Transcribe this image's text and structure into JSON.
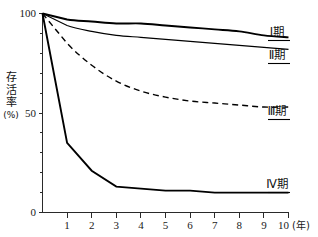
{
  "chart_data": {
    "type": "line",
    "title": "",
    "subtitle": "",
    "xlabel": "(年)",
    "ylabel": "存活率(%)",
    "xlim": [
      0,
      10
    ],
    "ylim": [
      0,
      100
    ],
    "grid": false,
    "legend_position": "right-inline",
    "x_tick_labels": [
      "1",
      "2",
      "3",
      "4",
      "5",
      "6",
      "7",
      "8",
      "9",
      "10"
    ],
    "x_ticks": [
      1,
      2,
      3,
      4,
      5,
      6,
      7,
      8,
      9,
      10
    ],
    "y_tick_labels": [
      "0",
      "50",
      "100"
    ],
    "y_ticks": [
      0,
      50,
      100
    ],
    "y_minor_ticks": [
      10,
      20,
      30,
      40,
      60,
      70,
      80,
      90
    ],
    "x": [
      0,
      1,
      2,
      3,
      4,
      5,
      6,
      7,
      8,
      9,
      10
    ],
    "series": [
      {
        "name": "Ⅰ期",
        "style": "solid-thick",
        "values": [
          100,
          97,
          96,
          95,
          95,
          94,
          93,
          92,
          91,
          89,
          88
        ]
      },
      {
        "name": "Ⅱ期",
        "style": "solid-thin",
        "values": [
          100,
          94,
          91,
          89,
          88,
          87,
          86,
          85,
          84,
          83,
          82
        ]
      },
      {
        "name": "Ⅲ期",
        "style": "dashed",
        "values": [
          100,
          85,
          74,
          66,
          61,
          58,
          56,
          55,
          54,
          53,
          53
        ]
      },
      {
        "name": "Ⅳ期",
        "style": "solid-thick",
        "values": [
          100,
          35,
          21,
          13,
          12,
          11,
          11,
          10,
          10,
          10,
          10
        ]
      }
    ],
    "annotations": [
      {
        "text": "Ⅰ期",
        "at_x": 10,
        "at_y": 88
      },
      {
        "text": "Ⅱ期",
        "at_x": 10,
        "at_y": 82
      },
      {
        "text": "Ⅲ期",
        "at_x": 10,
        "at_y": 53
      },
      {
        "text": "Ⅳ期",
        "at_x": 10,
        "at_y": 10
      }
    ]
  },
  "axis": {
    "y_label_chars": [
      "存",
      "活",
      "率"
    ],
    "y_label_unit": "(%)",
    "y_tick_0": "0",
    "y_tick_50": "50",
    "y_tick_100": "100",
    "x_unit": "(年)",
    "x_tick_1": "1",
    "x_tick_2": "2",
    "x_tick_3": "3",
    "x_tick_4": "4",
    "x_tick_5": "5",
    "x_tick_6": "6",
    "x_tick_7": "7",
    "x_tick_8": "8",
    "x_tick_9": "9",
    "x_tick_10": "10"
  },
  "labels": {
    "stage1": "Ⅰ期",
    "stage2": "Ⅱ期",
    "stage3": "Ⅲ期",
    "stage4": "Ⅳ期"
  }
}
